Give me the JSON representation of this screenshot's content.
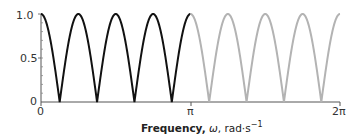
{
  "chart_data": {
    "type": "line",
    "title": "",
    "xlabel": "Frequency, ω, rad·s⁻¹",
    "xlabel_parts": {
      "bold": "Frequency,",
      "symbol": "ω",
      "unit": ", rad·s",
      "exponent": "−1"
    },
    "ylabel": "",
    "xlim": [
      0,
      6.2832
    ],
    "ylim": [
      0,
      1.0
    ],
    "x_ticks": [
      {
        "value": 0,
        "label": "0"
      },
      {
        "value": 3.1416,
        "label": "π"
      },
      {
        "value": 6.2832,
        "label": "2π"
      }
    ],
    "y_ticks": [
      {
        "value": 0,
        "label": "0"
      },
      {
        "value": 0.5,
        "label": "0.5"
      },
      {
        "value": 1.0,
        "label": "1.0"
      }
    ],
    "grid": false,
    "function": "|cos(4ω)|",
    "series": [
      {
        "name": "0 to π",
        "color": "#111111",
        "x_range": [
          0,
          3.1416
        ],
        "peaks_x": [
          0,
          0.7854,
          1.5708,
          2.3562,
          3.1416
        ],
        "zeros_x": [
          0.3927,
          1.1781,
          1.9635,
          2.7489
        ]
      },
      {
        "name": "π to 2π",
        "color": "#b3b3b3",
        "x_range": [
          3.1416,
          6.2832
        ],
        "peaks_x": [
          3.927,
          4.7124,
          5.4978,
          6.2832
        ],
        "zeros_x": [
          3.5343,
          4.3197,
          5.1051,
          5.8905
        ]
      }
    ]
  },
  "labels": {
    "y_1": "1.0",
    "y_05": "0.5",
    "y_0": "0",
    "x_0": "0",
    "x_pi": "π",
    "x_2pi": "2π",
    "xlabel_bold": "Frequency,",
    "xlabel_symbol": "ω",
    "xlabel_unit": ", rad·s",
    "xlabel_exp": "−1"
  }
}
